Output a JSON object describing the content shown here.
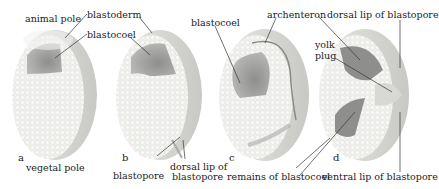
{
  "diagram": {
    "colors": {
      "background": "#ffffff",
      "embryo_face": "#eeeeec",
      "embryo_cells": "#f8f8f6",
      "embryo_rim": "#d6d6d2",
      "cavity": "#9a9a98",
      "cavity_light": "#bdbdbb",
      "leader_line": "#333333",
      "text": "#222222"
    },
    "panels": [
      {
        "letter": "a",
        "labels": [
          "animal pole",
          "blastoderm",
          "blastocoel",
          "vegetal pole"
        ]
      },
      {
        "letter": "b",
        "labels": [
          "blastoderm",
          "blastocoel",
          "blastopore",
          "dorsal lip of",
          "blastopore"
        ]
      },
      {
        "letter": "c",
        "labels": [
          "blastocoel",
          "archenteron",
          "remains of blastocoel"
        ]
      },
      {
        "letter": "d",
        "labels": [
          "dorsal lip of blastopore",
          "yolk",
          "plug",
          "ventral lip of blastopore"
        ]
      }
    ]
  }
}
